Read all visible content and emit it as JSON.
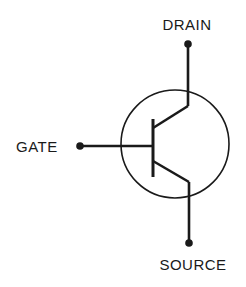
{
  "diagram": {
    "type": "transistor-schematic-symbol",
    "labels": {
      "drain": "DRAIN",
      "gate": "GATE",
      "source": "SOURCE"
    },
    "terminals": [
      {
        "name": "DRAIN",
        "position": "top"
      },
      {
        "name": "GATE",
        "position": "left"
      },
      {
        "name": "SOURCE",
        "position": "bottom"
      }
    ],
    "colors": {
      "stroke": "#1a1a1a",
      "background": "#ffffff"
    }
  }
}
